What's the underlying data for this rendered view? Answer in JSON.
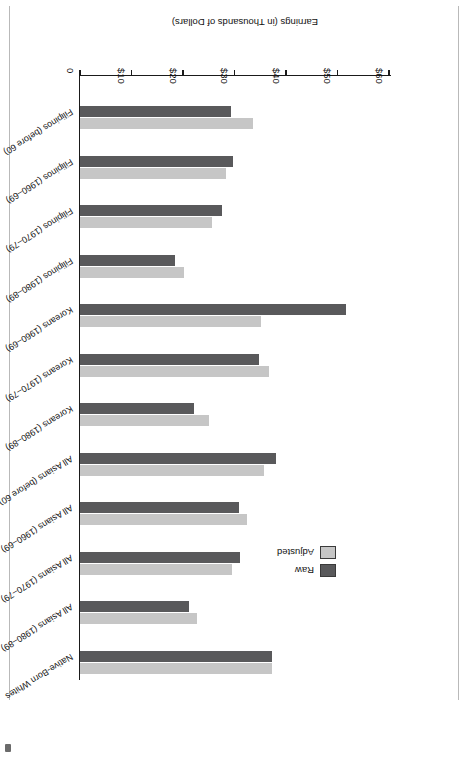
{
  "figure": {
    "axis_title": "Earnings (in Thousands of Dollars)",
    "orientation_note": "page-rotated-180"
  },
  "legend": {
    "position": "upper-left-of-plot",
    "entries": [
      {
        "label": "Raw",
        "color": "#59595b",
        "key": "raw"
      },
      {
        "label": "Adjusted",
        "color": "#c6c6c6",
        "key": "adjusted"
      }
    ]
  },
  "axis": {
    "ticks": [
      {
        "label": "0",
        "value": 0
      },
      {
        "label": "$10",
        "value": 10
      },
      {
        "label": "$20",
        "value": 20
      },
      {
        "label": "$30",
        "value": 30
      },
      {
        "label": "$40",
        "value": 40
      },
      {
        "label": "$50",
        "value": 50
      },
      {
        "label": "$60",
        "value": 60
      }
    ]
  },
  "chart_data": {
    "type": "bar",
    "orientation": "horizontal",
    "title": "",
    "xlabel": "Earnings (in Thousands of Dollars)",
    "ylabel": "",
    "xlim": [
      0,
      60
    ],
    "grid": false,
    "legend_position": "upper left",
    "categories": [
      "Native-Born Whites",
      "All Asians (1980–89)",
      "All Asians (1970–79)",
      "All Asians (1960–69)",
      "All Asians (before 60)",
      "Koreans (1980–89)",
      "Koreans (1970–79)",
      "Koreans (1960–69)",
      "Filipinos (1980–89)",
      "Filipinos (1970–79)",
      "Filipinos (1960–69)",
      "Filipinos (before 60)"
    ],
    "series": [
      {
        "name": "Raw",
        "color": "#59595b",
        "values": [
          37.3,
          21.2,
          31.0,
          30.8,
          38.1,
          22.1,
          34.8,
          51.6,
          18.4,
          27.5,
          29.8,
          29.3
        ]
      },
      {
        "name": "Adjusted",
        "color": "#c6c6c6",
        "values": [
          37.3,
          22.7,
          29.6,
          32.5,
          35.7,
          25.0,
          36.7,
          35.1,
          20.1,
          25.6,
          28.4,
          33.6
        ]
      }
    ]
  }
}
